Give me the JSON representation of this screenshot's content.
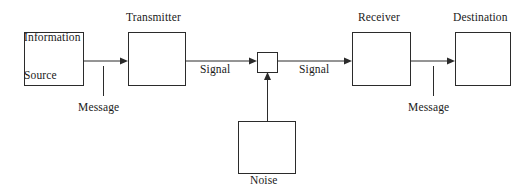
{
  "diagram": {
    "type": "block-flow-diagram",
    "canvas": {
      "width": 527,
      "height": 193,
      "background": "#ffffff"
    },
    "stroke_color": "#2b2b2b",
    "text_color": "#1a1a1a",
    "nodes": [
      {
        "id": "information-source",
        "label_line1": "Information",
        "label_line2": "Source",
        "label_x": 24,
        "label_y": 6,
        "box": {
          "x": 24,
          "y": 32,
          "w": 59,
          "h": 53
        }
      },
      {
        "id": "transmitter",
        "label_line1": "Transmitter",
        "label_line2": "",
        "label_x": 126,
        "label_y": 11,
        "box": {
          "x": 128,
          "y": 32,
          "w": 57,
          "h": 53
        }
      },
      {
        "id": "noise-junction",
        "label_line1": "",
        "label_line2": "",
        "label_x": 0,
        "label_y": 0,
        "box": {
          "x": 257,
          "y": 52,
          "w": 20,
          "h": 20
        }
      },
      {
        "id": "receiver",
        "label_line1": "Receiver",
        "label_line2": "",
        "label_x": 358,
        "label_y": 11,
        "box": {
          "x": 352,
          "y": 32,
          "w": 58,
          "h": 53
        }
      },
      {
        "id": "destination",
        "label_line1": "Destination",
        "label_line2": "",
        "label_x": 453,
        "label_y": 11,
        "box": {
          "x": 455,
          "y": 32,
          "w": 55,
          "h": 53
        }
      },
      {
        "id": "noise-source",
        "label_line1": "Noise",
        "label_line2": "",
        "label_x": 250,
        "label_y": 174,
        "box": {
          "x": 238,
          "y": 121,
          "w": 57,
          "h": 52
        }
      }
    ],
    "edges": [
      {
        "id": "source-to-transmitter",
        "label": "Message",
        "label_x": 78,
        "label_y": 101,
        "from": "information-source",
        "to": "transmitter",
        "tick_x": 103,
        "tick_y1": 66,
        "tick_y2": 96
      },
      {
        "id": "transmitter-to-noise",
        "label": "Signal",
        "label_x": 200,
        "label_y": 63,
        "from": "transmitter",
        "to": "noise-junction"
      },
      {
        "id": "noise-to-receiver",
        "label": "Signal",
        "label_x": 299,
        "label_y": 63,
        "from": "noise-junction",
        "to": "receiver"
      },
      {
        "id": "receiver-to-destination",
        "label": "Message",
        "label_x": 408,
        "label_y": 101,
        "from": "receiver",
        "to": "destination",
        "tick_x": 433,
        "tick_y1": 66,
        "tick_y2": 96
      },
      {
        "id": "noise-to-junction",
        "label": "",
        "label_x": 0,
        "label_y": 0,
        "from": "noise-source",
        "to": "noise-junction"
      }
    ]
  }
}
